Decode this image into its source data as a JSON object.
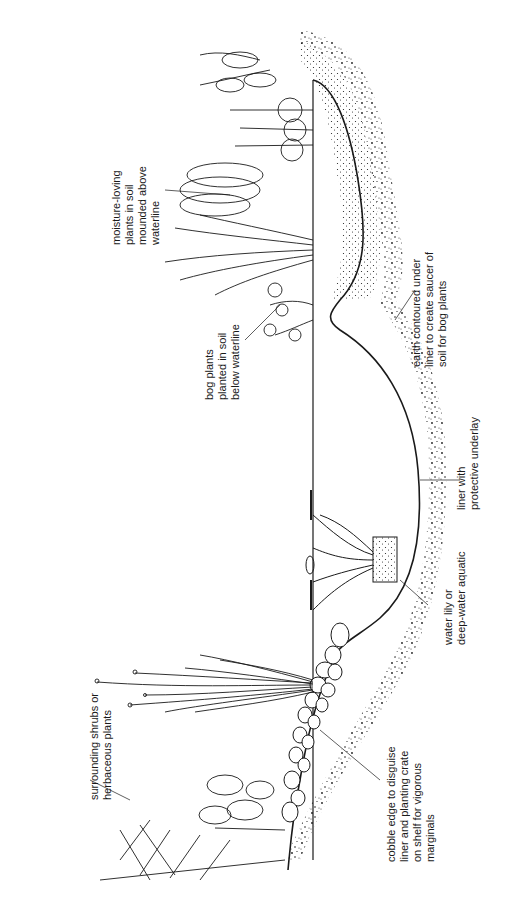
{
  "diagram": {
    "type": "pond cross-section line drawing (rotated 90° counter-clockwise)",
    "colors": {
      "ink": "#1a1a1a",
      "background": "#ffffff"
    },
    "labels": [
      {
        "id": "surrounding",
        "lines": [
          "surrounding shrubs or",
          "herbaceous plants"
        ]
      },
      {
        "id": "moisture",
        "lines": [
          "moisture-loving",
          "plants in soil",
          "mounded above",
          "waterline"
        ]
      },
      {
        "id": "bog",
        "lines": [
          "bog plants",
          "planted in soil",
          "below waterline"
        ]
      },
      {
        "id": "earth",
        "lines": [
          "earth contoured under",
          "liner to create saucer of",
          "soil for bog plants"
        ]
      },
      {
        "id": "liner",
        "lines": [
          "liner with",
          "protective underlay"
        ]
      },
      {
        "id": "waterlily",
        "lines": [
          "water lily or",
          "deep-water aquatic"
        ]
      },
      {
        "id": "cobble",
        "lines": [
          "cobble edge to disguise",
          "liner and planting crate",
          "on shelf for vigorous",
          "marginals"
        ]
      }
    ]
  }
}
